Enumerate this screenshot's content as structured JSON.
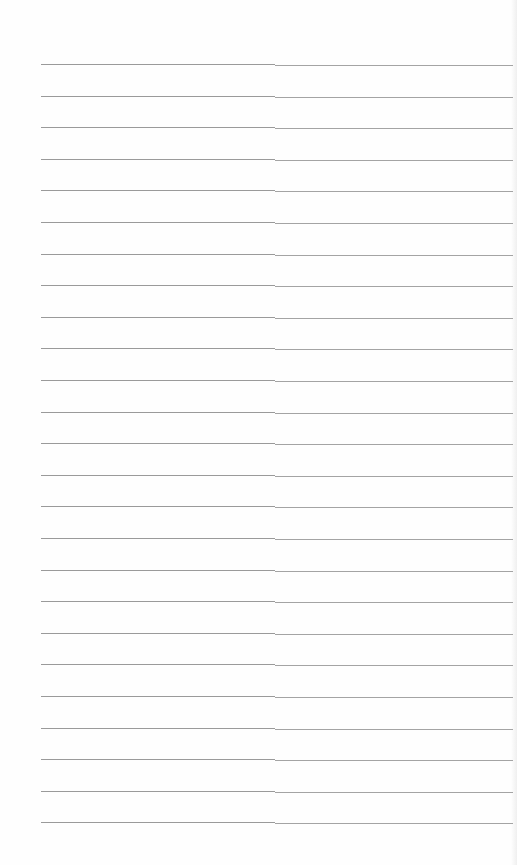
{
  "page": {
    "type": "lined-paper",
    "background": "#ffffff",
    "line_color": "#9a9a9a",
    "line_count": 25,
    "first_line_y": 64,
    "line_spacing": 31.6,
    "line_left_x": 41,
    "line_right_x": 513,
    "text": ""
  }
}
